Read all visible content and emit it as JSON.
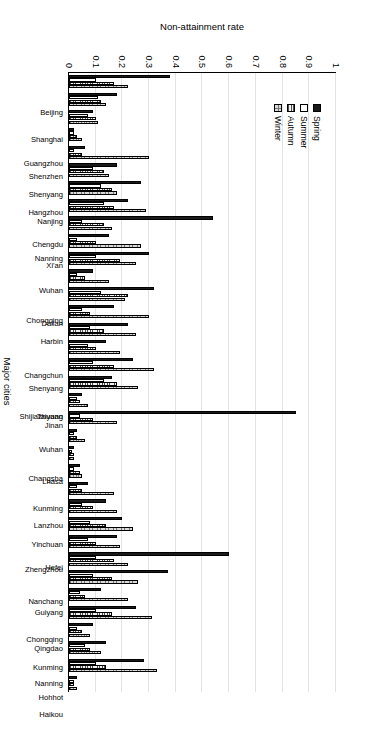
{
  "chart_data": {
    "type": "bar",
    "title": "",
    "xlabel": "Major cities",
    "ylabel": "Non-attainment rate",
    "ylim": [
      0,
      1
    ],
    "yticks": [
      "0",
      "0.1",
      "0.2",
      "0.3",
      "0.4",
      "0.5",
      "0.6",
      "0.7",
      "0.8",
      "0.9",
      "1"
    ],
    "grid": true,
    "legend_position": "upper-left",
    "orientation": "vertical-bars-rotated-canvas",
    "categories": [
      "Beijing",
      "Shanghai",
      "Guangzhou",
      "Shenzhen",
      "Shenyang",
      "Hangzhou",
      "Nanjing",
      "Chengdu",
      "Nanning",
      "Xi'an",
      "Wuhan",
      "Chongqing",
      "Dalian",
      "Harbin",
      "Changchun",
      "Shenyang",
      "Shijiazhuang",
      "Taiyuan",
      "Jinan",
      "Wuhan",
      "Changsha",
      "Lhasa",
      "Kunming",
      "Lanzhou",
      "Yinchuan",
      "Zhengzhou",
      "Hefei",
      "Nanchang",
      "Guiyang",
      "Chongqing",
      "Qingdao",
      "Kunming",
      "Nanning",
      "Hohhot",
      "Haikou"
    ],
    "series": [
      {
        "name": "Spring",
        "values": [
          0.38,
          0.18,
          0.09,
          0.02,
          0.06,
          0.18,
          0.27,
          0.22,
          0.54,
          0.15,
          0.3,
          0.09,
          0.32,
          0.17,
          0.22,
          0.14,
          0.24,
          0.16,
          0.05,
          0.85,
          0.03,
          0.02,
          0.04,
          0.07,
          0.14,
          0.2,
          0.18,
          0.6,
          0.37,
          0.12,
          0.25,
          0.09,
          0.14,
          0.28,
          0.03
        ]
      },
      {
        "name": "Summer",
        "values": [
          0.1,
          0.11,
          0.07,
          0.02,
          0.02,
          0.09,
          0.12,
          0.13,
          0.05,
          0.03,
          0.1,
          0.03,
          0.12,
          0.05,
          0.08,
          0.07,
          0.09,
          0.13,
          0.03,
          0.04,
          0.02,
          0.01,
          0.02,
          0.03,
          0.05,
          0.08,
          0.07,
          0.1,
          0.09,
          0.04,
          0.1,
          0.03,
          0.06,
          0.1,
          0.02
        ]
      },
      {
        "name": "Autumn",
        "values": [
          0.17,
          0.12,
          0.1,
          0.03,
          0.05,
          0.13,
          0.16,
          0.17,
          0.13,
          0.1,
          0.19,
          0.06,
          0.22,
          0.08,
          0.13,
          0.1,
          0.17,
          0.18,
          0.04,
          0.09,
          0.03,
          0.02,
          0.04,
          0.05,
          0.09,
          0.14,
          0.1,
          0.17,
          0.16,
          0.06,
          0.16,
          0.05,
          0.08,
          0.14,
          0.02
        ]
      },
      {
        "name": "Winter",
        "values": [
          0.22,
          0.14,
          0.11,
          0.05,
          0.3,
          0.15,
          0.18,
          0.29,
          0.16,
          0.27,
          0.25,
          0.15,
          0.21,
          0.3,
          0.25,
          0.19,
          0.32,
          0.26,
          0.07,
          0.18,
          0.06,
          0.02,
          0.05,
          0.17,
          0.18,
          0.24,
          0.19,
          0.22,
          0.26,
          0.22,
          0.31,
          0.08,
          0.12,
          0.33,
          0.03
        ]
      }
    ]
  },
  "legend": {
    "items": [
      "Spring",
      "Summer",
      "Autumn",
      "Winter"
    ]
  }
}
